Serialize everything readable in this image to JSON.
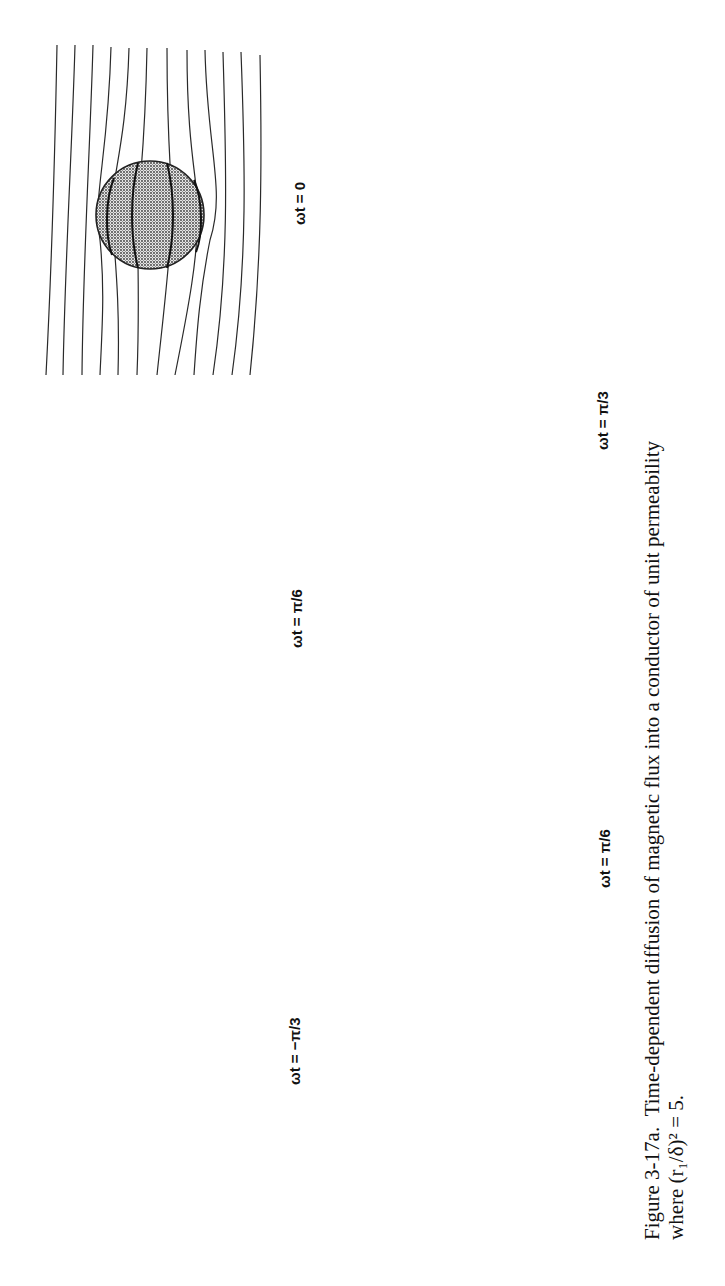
{
  "figure": {
    "number": "Figure 3-17a.",
    "caption_line1": "Time-dependent diffusion of magnetic flux into a conductor of unit permeability",
    "caption_line2": "where (r₁/δ)² = 5.",
    "orientation": "rotated 90° counter-clockwise on page",
    "panels": [
      {
        "id": "top-row-left",
        "label": "ωt = −π/3",
        "flux_lines": 6,
        "flux_excluded": true
      },
      {
        "id": "top-row-middle",
        "label": "ωt = π/6",
        "flux_lines": 10,
        "flux_lines_inside": 2
      },
      {
        "id": "top-row-right",
        "label": "ωt = 0",
        "flux_lines": 12,
        "flux_lines_inside": 4
      },
      {
        "id": "bottom-row-left",
        "label": "ωt = π/6",
        "flux_lines": 10,
        "flux_lines_inside": 4
      },
      {
        "id": "bottom-row-right",
        "label": "ωt = π/3",
        "flux_lines": 6,
        "flux_lines_inside": 4
      }
    ]
  },
  "colors": {
    "ink": "#111111",
    "background": "#ffffff",
    "conductor_fill": "stippled gray"
  }
}
